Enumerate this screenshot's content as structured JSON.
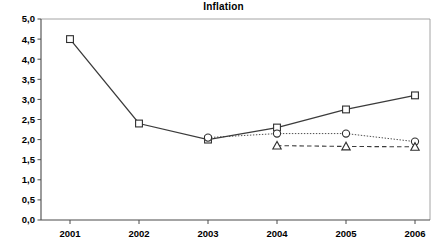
{
  "chart_data": {
    "type": "line",
    "title": "Inflation",
    "xlabel": "",
    "ylabel": "",
    "x": [
      "2001",
      "2002",
      "2003",
      "2004",
      "2005",
      "2006"
    ],
    "categories": [
      "2001",
      "2002",
      "2003",
      "2004",
      "2005",
      "2006"
    ],
    "ylim": [
      0.0,
      5.0
    ],
    "ytick_labels": [
      "0,0",
      "0,5",
      "1,0",
      "1,5",
      "2,0",
      "2,5",
      "3,0",
      "3,5",
      "4,0",
      "4,5",
      "5,0"
    ],
    "ytick_values": [
      0.0,
      0.5,
      1.0,
      1.5,
      2.0,
      2.5,
      3.0,
      3.5,
      4.0,
      4.5,
      5.0
    ],
    "xtick_labels": [
      "2001",
      "2002",
      "2003",
      "2004",
      "2005",
      "2006"
    ],
    "grid": false,
    "legend": "none",
    "series": [
      {
        "name": "series-square",
        "marker": "square",
        "line_style": "solid",
        "x": [
          "2001",
          "2002",
          "2003",
          "2004",
          "2005",
          "2006"
        ],
        "values": [
          4.5,
          2.4,
          2.0,
          2.3,
          2.75,
          3.1
        ]
      },
      {
        "name": "series-circle",
        "marker": "circle",
        "line_style": "dotted",
        "x": [
          "2003",
          "2004",
          "2005",
          "2006"
        ],
        "values": [
          2.05,
          2.15,
          2.15,
          1.95
        ]
      },
      {
        "name": "series-triangle",
        "marker": "triangle",
        "line_style": "dashed",
        "x": [
          "2004",
          "2005",
          "2006"
        ],
        "values": [
          1.85,
          1.83,
          1.82
        ]
      }
    ],
    "colors": {
      "line": "#3b3b3b",
      "marker_fill": "#ffffff",
      "marker_stroke": "#2e2e2e",
      "axis": "#4a4a4a",
      "frame": "#9a9a9a",
      "background": "#ffffff"
    }
  }
}
